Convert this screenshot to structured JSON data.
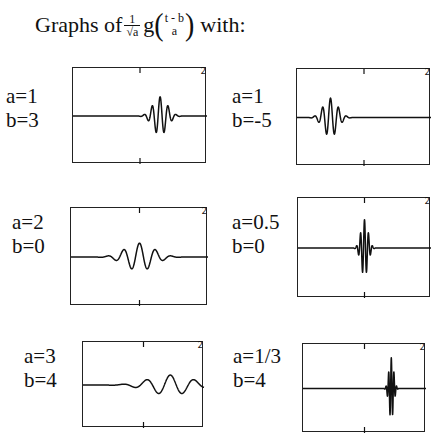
{
  "title": {
    "prefix": "Graphs of",
    "frac_num": "1",
    "frac_den_root": "a",
    "sqrt_sign": "√",
    "func": "g",
    "arg_num": "t - b",
    "arg_den": "a",
    "suffix": "with:"
  },
  "panels": [
    {
      "a_label": "a=1",
      "b_label": "b=3",
      "a": 1,
      "b": 3,
      "corner": "2",
      "box": {
        "x": 72,
        "y": 67,
        "w": 134,
        "h": 96
      },
      "label_pos": {
        "x": 6,
        "y": 84
      }
    },
    {
      "a_label": "a=1",
      "b_label": "b=-5",
      "a": 1,
      "b": -5,
      "corner": "2",
      "box": {
        "x": 296,
        "y": 68,
        "w": 134,
        "h": 97
      },
      "label_pos": {
        "x": 232,
        "y": 84
      }
    },
    {
      "a_label": "a=2",
      "b_label": "b=0",
      "a": 2,
      "b": 0,
      "corner": "2",
      "box": {
        "x": 70,
        "y": 207,
        "w": 137,
        "h": 98
      },
      "label_pos": {
        "x": 12,
        "y": 210
      }
    },
    {
      "a_label": "a=0.5",
      "b_label": "b=0",
      "a": 0.5,
      "b": 0,
      "corner": "2",
      "box": {
        "x": 297,
        "y": 197,
        "w": 133,
        "h": 100
      },
      "label_pos": {
        "x": 232,
        "y": 210
      }
    },
    {
      "a_label": "a=3",
      "b_label": "b=4",
      "a": 3,
      "b": 4,
      "corner": "2",
      "box": {
        "x": 82,
        "y": 341,
        "w": 121,
        "h": 86
      },
      "label_pos": {
        "x": 24,
        "y": 344
      }
    },
    {
      "a_label": "a=1/3",
      "b_label": "b=4",
      "a": 0.3333,
      "b": 4,
      "corner": "2",
      "box": {
        "x": 302,
        "y": 343,
        "w": 123,
        "h": 89
      },
      "label_pos": {
        "x": 233,
        "y": 344
      }
    }
  ],
  "style": {
    "ink": "#111111",
    "background": "#ffffff"
  }
}
